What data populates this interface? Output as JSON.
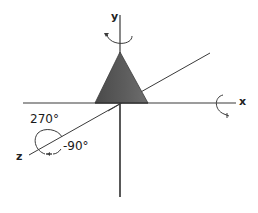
{
  "diagram": {
    "type": "3d-axis-rotation",
    "colors": {
      "background": "#ffffff",
      "axis": "#3a3a3a",
      "cone_fill": "#555555",
      "cone_shade": "#6a6a6a",
      "text": "#222222"
    },
    "axes": {
      "x": {
        "label": "x"
      },
      "y": {
        "label": "y"
      },
      "z": {
        "label": "z"
      }
    },
    "rotation_arrows": [
      {
        "axis": "y",
        "icon": "rotation-arrow-icon"
      },
      {
        "axis": "x",
        "icon": "rotation-arrow-icon"
      },
      {
        "axis": "z",
        "icon": "rotation-arrow-icon"
      }
    ],
    "angles": {
      "positive": "270°",
      "negative": "-90°"
    },
    "object": {
      "shape": "cone",
      "icon": "cone-icon"
    }
  }
}
